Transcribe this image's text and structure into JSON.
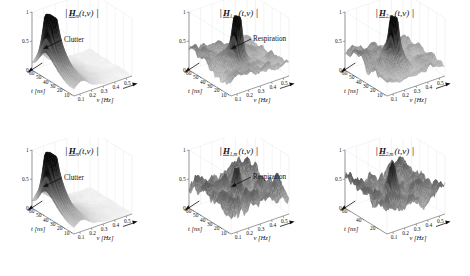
{
  "figure": {
    "background": "#ffffff",
    "rows": 2,
    "cols": 3,
    "surface_colormap": "grayscale-bone"
  },
  "axes_common": {
    "z": {
      "label": "",
      "ticks": [
        "0",
        "0.5",
        "1"
      ],
      "values": [
        0,
        0.5,
        1
      ],
      "lim": [
        0,
        1
      ]
    },
    "t": {
      "label": "t [ns]",
      "label_symbol": "t",
      "label_unit": "[ns]",
      "ticks": [
        "10",
        "20",
        "30",
        "40",
        "50",
        "60"
      ],
      "values": [
        10,
        20,
        30,
        40,
        50,
        60
      ],
      "lim": [
        5,
        65
      ],
      "direction_arrow": true
    },
    "v": {
      "label": "ν [Hz]",
      "label_symbol": "ν",
      "label_unit": "[Hz]",
      "ticks": [
        "0.1",
        "0.2",
        "0.3",
        "0.4",
        "0.5"
      ],
      "values": [
        0.1,
        0.2,
        0.3,
        0.4,
        0.5
      ],
      "lim": [
        0.05,
        0.55
      ],
      "direction_arrow": true
    }
  },
  "panels": [
    {
      "id": "top-left",
      "title": "|H_m(t,ν)|",
      "title_parts": {
        "bar_left": "|",
        "symbol": "H",
        "underlined": true,
        "subscript": "m",
        "args": "(t,ν)",
        "bar_right": "|"
      },
      "annotation": {
        "text": "Clutter",
        "arrow": true
      },
      "t_ticks": [
        "10",
        "20",
        "30",
        "40",
        "50",
        "60"
      ],
      "surface_type": "single-clutter-ridge",
      "peak_value": 1.0,
      "noise_level": 0.03
    },
    {
      "id": "top-middle",
      "title": "|H_1,m(t,ν)|",
      "title_parts": {
        "bar_left": "|",
        "symbol": "H",
        "underlined": true,
        "subscript": "1,m",
        "args": "(t,ν)",
        "bar_right": "|"
      },
      "annotation": {
        "text": "Respiration",
        "arrow": true
      },
      "t_ticks": [
        "10",
        "20",
        "30",
        "40",
        "50",
        "60"
      ],
      "surface_type": "noisy-with-central-peak",
      "peak_value": 1.0,
      "noise_level": 0.26
    },
    {
      "id": "top-right",
      "title": "|H_2,m(t,ν)|",
      "title_parts": {
        "bar_left": "|",
        "symbol": "H",
        "underlined": true,
        "subscript": "2,m",
        "args": "(t,ν)",
        "bar_right": "|"
      },
      "annotation": null,
      "t_ticks": [
        "10",
        "20",
        "30",
        "40",
        "50",
        "60"
      ],
      "surface_type": "noisy-with-central-peak",
      "peak_value": 1.0,
      "noise_level": 0.2
    },
    {
      "id": "bottom-left",
      "title": "|H_m(t,ν)|",
      "title_parts": {
        "bar_left": "|",
        "symbol": "H",
        "underlined": true,
        "subscript": "m",
        "args": "(t,ν)",
        "bar_right": "|"
      },
      "annotation": {
        "text": "Clutter",
        "arrow": true
      },
      "t_ticks": [
        "10",
        "20",
        "30",
        "40",
        "50",
        "60"
      ],
      "surface_type": "single-clutter-ridge",
      "peak_value": 1.0,
      "noise_level": 0.03
    },
    {
      "id": "bottom-middle",
      "title": "|H_1,m(t,ν)|",
      "title_parts": {
        "bar_left": "|",
        "symbol": "H",
        "underlined": true,
        "subscript": "1,m",
        "args": "(t,ν)",
        "bar_right": "|"
      },
      "annotation": {
        "text": "Respiration",
        "arrow": true
      },
      "t_ticks": [
        "10",
        "20",
        "30",
        "40",
        "50",
        "60"
      ],
      "surface_type": "rough-noise-field",
      "peak_value": 1.0,
      "noise_level": 0.55
    },
    {
      "id": "bottom-right",
      "title": "|H_2,m(t,ν)|",
      "title_parts": {
        "bar_left": "|",
        "symbol": "H",
        "underlined": true,
        "subscript": "2,m",
        "args": "(t,ν)",
        "bar_right": "|"
      },
      "annotation": null,
      "t_ticks": [
        "20",
        "40",
        "60"
      ],
      "surface_type": "rough-noise-field",
      "peak_value": 1.0,
      "noise_level": 0.55
    }
  ],
  "chart_data": {
    "type": "surface",
    "xlabel": "ν [Hz]",
    "ylabel": "t [ns]",
    "zlabel": "magnitude",
    "xlim": [
      0.05,
      0.55
    ],
    "ylim": [
      5,
      65
    ],
    "zlim": [
      0,
      1
    ],
    "xticks": [
      0.1,
      0.2,
      0.3,
      0.4,
      0.5
    ],
    "yticks": [
      10,
      20,
      30,
      40,
      50,
      60
    ],
    "zticks": [
      0,
      0.5,
      1
    ],
    "grid": false,
    "legend": "none",
    "panels": [
      {
        "name": "|H_m(t,ν)|",
        "row": 1,
        "col": 1,
        "feature": "clutter",
        "feature_location": {
          "t": 52,
          "v": 0.1
        },
        "feature_amplitude": 0.62,
        "background_amplitude": 0.05
      },
      {
        "name": "|H_1,m(t,ν)|",
        "row": 1,
        "col": 2,
        "feature": "respiration",
        "feature_location": {
          "t": 30,
          "v": 0.28
        },
        "feature_amplitude": 0.58,
        "background_amplitude": 0.22
      },
      {
        "name": "|H_2,m(t,ν)|",
        "row": 1,
        "col": 3,
        "feature": "respiration",
        "feature_location": {
          "t": 30,
          "v": 0.28
        },
        "feature_amplitude": 0.55,
        "background_amplitude": 0.17
      },
      {
        "name": "|H_m(t,ν)|",
        "row": 2,
        "col": 1,
        "feature": "clutter",
        "feature_location": {
          "t": 52,
          "v": 0.1
        },
        "feature_amplitude": 0.62,
        "background_amplitude": 0.05
      },
      {
        "name": "|H_1,m(t,ν)|",
        "row": 2,
        "col": 2,
        "feature": "respiration",
        "feature_location": {
          "t": 30,
          "v": 0.28
        },
        "feature_amplitude": 0.6,
        "background_amplitude": 0.45
      },
      {
        "name": "|H_2,m(t,ν)|",
        "row": 2,
        "col": 3,
        "feature": "noise",
        "feature_location": {
          "t": 30,
          "v": 0.28
        },
        "feature_amplitude": 0.58,
        "background_amplitude": 0.45
      }
    ]
  }
}
